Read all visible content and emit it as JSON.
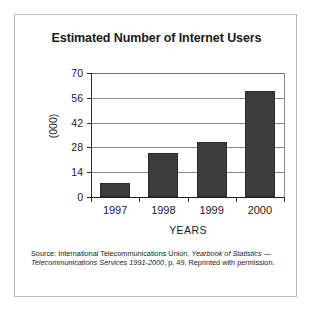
{
  "figure": {
    "title": "Estimated Number of Internet Users",
    "source_note": {
      "prefix": "Source: International Telecommunications Union, ",
      "italic_1": "Yearbook of Statistics",
      "middle": " — ",
      "italic_2": "Telecommunications Services 1991-2000",
      "suffix": ", p. 49. Reprinted with permission."
    },
    "colors": {
      "bar_fill": "#3c3c3c",
      "bar_edge": "#2a2a2a",
      "gridline": "#8a8a8a",
      "axis": "#1f1f1f",
      "frame": "#b9b9b9",
      "background": "#ffffff",
      "text": "#1a1a1a"
    }
  },
  "chart_data": {
    "type": "bar",
    "title": "Estimated Number of Internet Users",
    "xlabel": "YEARS",
    "ylabel": "(000)",
    "categories": [
      "1997",
      "1998",
      "1999",
      "2000"
    ],
    "values": [
      8,
      25,
      31,
      60
    ],
    "ylim": [
      0,
      70
    ],
    "yticks": [
      0,
      14,
      28,
      42,
      56,
      70
    ],
    "ytick_labels": [
      "0",
      "14",
      "28",
      "42",
      "56",
      "70"
    ],
    "grid": "horizontal",
    "legend": "none",
    "series": [
      {
        "name": "Estimated Internet Users (000)",
        "values": [
          8,
          25,
          31,
          60
        ]
      }
    ]
  }
}
